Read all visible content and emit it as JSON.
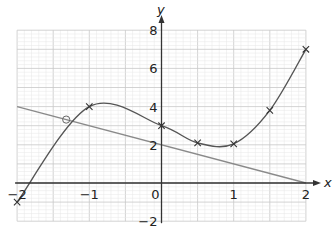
{
  "chart_data": {
    "type": "line",
    "title": "",
    "xlabel": "x",
    "ylabel": "y",
    "xlim": [
      -2,
      2
    ],
    "ylim": [
      -2,
      8
    ],
    "grid": true,
    "x_ticks": [
      -2,
      -1,
      0,
      1,
      2
    ],
    "x_tick_labels": [
      "−2",
      "−1",
      "0",
      "1",
      "2"
    ],
    "y_ticks": [
      -2,
      2,
      4,
      6,
      8
    ],
    "y_tick_labels": [
      "−2",
      "2",
      "4",
      "6",
      "8"
    ],
    "series": [
      {
        "name": "cubic curve",
        "kind": "smooth-curve",
        "marker": "cross",
        "color": "#555555",
        "x": [
          -2,
          -1,
          0,
          0.5,
          1,
          1.5,
          2
        ],
        "y": [
          -1,
          4,
          3,
          2.1,
          2.05,
          3.8,
          7
        ]
      },
      {
        "name": "straight line",
        "kind": "line",
        "marker": "none",
        "color": "#888888",
        "x": [
          -2,
          2
        ],
        "y": [
          4,
          0
        ]
      }
    ],
    "annotations": [
      {
        "type": "circle-marker",
        "label": "intersection",
        "x": -1.32,
        "y": 3.32
      }
    ]
  },
  "colors": {
    "grid_minor": "#e6e6e6",
    "grid_major": "#c8c8c8",
    "axis": "#333333",
    "curve": "#555555",
    "line": "#8a8a8a"
  }
}
